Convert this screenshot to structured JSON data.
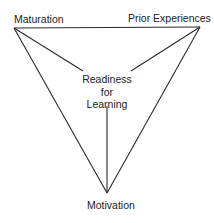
{
  "diagram": {
    "nodes": {
      "top_left": "Maturation",
      "top_right": "Prior Experiences",
      "bottom": "Motivation",
      "center": [
        "Readiness",
        "for",
        "Learning"
      ]
    },
    "edges": [
      {
        "from": "Maturation",
        "to": "Prior Experiences"
      },
      {
        "from": "Maturation",
        "to": "Motivation"
      },
      {
        "from": "Prior Experiences",
        "to": "Motivation"
      },
      {
        "from": "Maturation",
        "to": "Readiness for Learning"
      },
      {
        "from": "Prior Experiences",
        "to": "Readiness for Learning"
      },
      {
        "from": "Motivation",
        "to": "Readiness for Learning"
      }
    ],
    "line_color": "#2a2a2a"
  }
}
